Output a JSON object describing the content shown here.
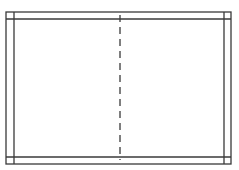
{
  "diagram": {
    "stroke_color": "#3a3a3a",
    "background": "#ffffff",
    "outer_rect": {
      "x": 6,
      "y": 12,
      "width": 225,
      "height": 152
    },
    "inner_lines": {
      "left_x": 14,
      "right_x": 224,
      "top_y": 19,
      "bottom_y": 157
    },
    "center_fold": {
      "x": 120,
      "y1": 15,
      "y2": 160,
      "style": "dashed"
    }
  }
}
